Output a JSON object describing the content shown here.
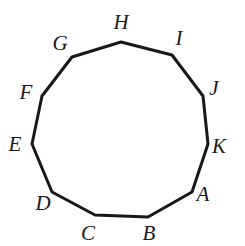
{
  "figure": {
    "shape_name": "hendecagon",
    "side_count": 11,
    "background_color": "#ffffff",
    "stroke_color": "#18181a",
    "stroke_width": 3,
    "label_color": "#18181a",
    "label_font_size": 21,
    "label_style": "italic",
    "canvas": {
      "width": 245,
      "height": 246
    }
  },
  "chart_data": {
    "type": "diagram",
    "closed": true,
    "vertices": [
      {
        "label": "A",
        "x": 192,
        "y": 192,
        "label_x": 203,
        "label_y": 194
      },
      {
        "label": "B",
        "x": 148,
        "y": 217,
        "label_x": 149,
        "label_y": 233
      },
      {
        "label": "C",
        "x": 95,
        "y": 215,
        "label_x": 88,
        "label_y": 233
      },
      {
        "label": "D",
        "x": 52,
        "y": 192,
        "label_x": 43,
        "label_y": 203
      },
      {
        "label": "E",
        "x": 32,
        "y": 144,
        "label_x": 15,
        "label_y": 144
      },
      {
        "label": "F",
        "x": 42,
        "y": 96,
        "label_x": 26,
        "label_y": 92
      },
      {
        "label": "G",
        "x": 72,
        "y": 57,
        "label_x": 60,
        "label_y": 43
      },
      {
        "label": "H",
        "x": 121,
        "y": 42,
        "label_x": 121,
        "label_y": 22
      },
      {
        "label": "I",
        "x": 172,
        "y": 55,
        "label_x": 179,
        "label_y": 38
      },
      {
        "label": "J",
        "x": 203,
        "y": 96,
        "label_x": 214,
        "label_y": 88
      },
      {
        "label": "K",
        "x": 208,
        "y": 144,
        "label_x": 219,
        "label_y": 146
      }
    ],
    "edges": [
      "AB",
      "BC",
      "CD",
      "DE",
      "EF",
      "FG",
      "GH",
      "HI",
      "IJ",
      "JK",
      "KA"
    ]
  }
}
